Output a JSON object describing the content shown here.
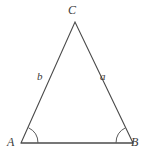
{
  "figure": {
    "kind": "geometry-diagram",
    "shape": "triangle",
    "background_color": "#ffffff",
    "stroke_color": "#4a4a4a",
    "label_color": "#3a3a3a"
  },
  "vertices": {
    "apex": {
      "name": "C",
      "label": "C",
      "x": 75,
      "y": 22
    },
    "bottom_left": {
      "name": "A",
      "label": "A",
      "x": 21,
      "y": 143
    },
    "bottom_right": {
      "name": "B",
      "label": "B",
      "x": 133,
      "y": 143
    }
  },
  "sides": {
    "left": {
      "name": "b",
      "label": "b",
      "from": "A",
      "to": "C"
    },
    "right": {
      "name": "a",
      "label": "a",
      "from": "C",
      "to": "B"
    },
    "base": {
      "name": "c",
      "label": "",
      "from": "A",
      "to": "B"
    }
  },
  "angles": [
    {
      "at": "A",
      "marker": "arc",
      "radius": 17
    },
    {
      "at": "B",
      "marker": "arc",
      "radius": 17
    }
  ]
}
